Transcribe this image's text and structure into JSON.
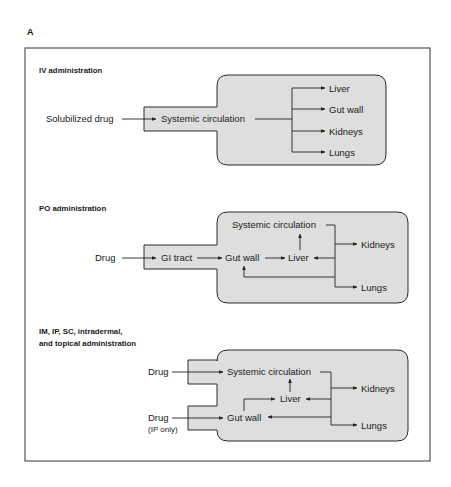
{
  "figure": {
    "panel_letter": "A",
    "colors": {
      "shape_fill": "#dedede",
      "line": "#222222",
      "frame": "#555555"
    }
  },
  "iv": {
    "title": "IV administration",
    "input": "Solubilized drug",
    "center": "Systemic circulation",
    "targets": [
      "Liver",
      "Gut wall",
      "Kidneys",
      "Lungs"
    ]
  },
  "po": {
    "title": "PO administration",
    "input": "Drug",
    "gi": "GI tract",
    "gut": "Gut wall",
    "liver": "Liver",
    "systemic": "Systemic circulation",
    "kidneys": "Kidneys",
    "lungs": "Lungs"
  },
  "im": {
    "title_line1": "IM, IP, SC, intradermal,",
    "title_line2": "and topical administration",
    "input1": "Drug",
    "input2": "Drug",
    "input2_note": "(IP only)",
    "systemic": "Systemic circulation",
    "liver": "Liver",
    "gut": "Gut wall",
    "kidneys": "Kidneys",
    "lungs": "Lungs"
  }
}
